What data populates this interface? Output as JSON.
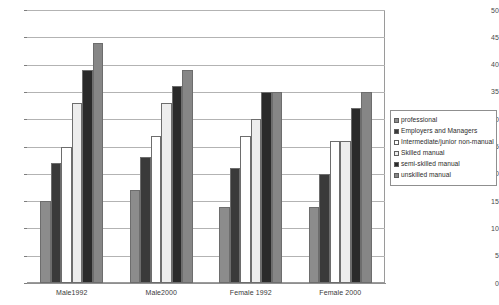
{
  "chart_data": {
    "type": "bar",
    "title": "",
    "subtitle": "",
    "xlabel": "",
    "ylabel": "",
    "ylim": [
      0,
      50
    ],
    "ytick_step": 5,
    "yticks": [
      0,
      5,
      10,
      15,
      20,
      25,
      30,
      35,
      40,
      45,
      50
    ],
    "grid": true,
    "legend_position": "right",
    "categories": [
      "Male1992",
      "Male2000",
      "Female 1992",
      "Female 2000"
    ],
    "series": [
      {
        "name": "professional",
        "color": "#8c8c8c",
        "values": [
          15,
          17,
          14,
          14
        ]
      },
      {
        "name": "Employers and Managers",
        "color": "#3a3a3a",
        "values": [
          22,
          23,
          21,
          20
        ]
      },
      {
        "name": "Intermediate/junior non-manual",
        "color": "#ffffff",
        "values": [
          25,
          27,
          27,
          26
        ]
      },
      {
        "name": "Skilled manual",
        "color": "#ededed",
        "values": [
          33,
          33,
          30,
          26
        ]
      },
      {
        "name": "semi-skilled manual",
        "color": "#2a2a2a",
        "values": [
          39,
          36,
          35,
          32
        ]
      },
      {
        "name": "unskilled manual",
        "color": "#868686",
        "values": [
          44,
          39,
          35,
          35
        ]
      }
    ]
  }
}
